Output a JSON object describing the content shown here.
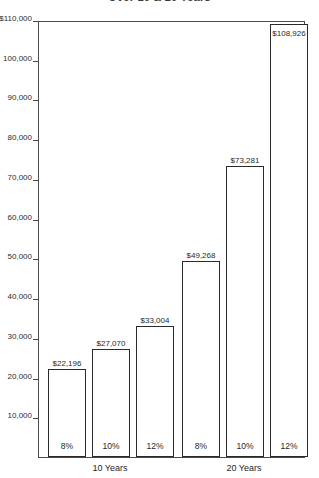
{
  "chart_data": {
    "type": "bar",
    "title": "Over 10 & 20 Years",
    "xlabel": "",
    "ylabel": "",
    "ylim": [
      0,
      110000
    ],
    "grid": false,
    "legend": null,
    "categories": [
      "8%",
      "10%",
      "12%",
      "8%",
      "10%",
      "12%"
    ],
    "values": [
      22196,
      27070,
      33004,
      49268,
      73281,
      108926
    ],
    "value_labels": [
      "$22,196",
      "$27,070",
      "$33,004",
      "$49,268",
      "$73,281",
      "$108,926"
    ],
    "groups": [
      {
        "label": "10 Years",
        "category_indices": [
          0,
          1,
          2
        ]
      },
      {
        "label": "20 Years",
        "category_indices": [
          3,
          4,
          5
        ]
      }
    ],
    "y_ticks": [
      110000,
      100000,
      90000,
      80000,
      70000,
      60000,
      50000,
      40000,
      30000,
      20000,
      10000
    ],
    "y_tick_labels": [
      "$110,000",
      "100,000",
      "90,000",
      "80,000",
      "70,000",
      "60,000",
      "50,000",
      "40,000",
      "30,000",
      "20,000",
      "10,000"
    ],
    "colors": {
      "bar_fill": "#ffffff",
      "bar_stroke": "#2a2a2a",
      "axis": "#4a4a4a",
      "text": "#1f1f1f",
      "background": "#ffffff"
    }
  }
}
